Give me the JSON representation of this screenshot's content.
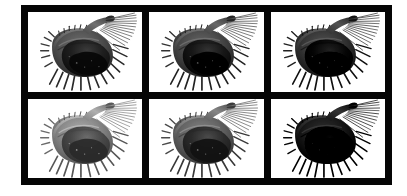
{
  "figure": {
    "title": "",
    "layout": {
      "type": "image-grid",
      "rows": 2,
      "columns": 3,
      "frame_color": "#050505",
      "panel_background": "#ffffff",
      "page_background": "#ffffff",
      "frame_x": 21,
      "frame_y": 5,
      "frame_width": 371,
      "frame_height": 180,
      "frame_padding": 7,
      "panel_gap": 7
    },
    "subject": {
      "description": "grayscale electron-micrograph style view of a spiny carapaced micro-organism",
      "common_name": "spined specimen",
      "orientation": "body lower-left, appendage and bristles extending upper-right",
      "color_mode": "grayscale"
    },
    "panels": [
      {
        "id": "panel-r1c1",
        "row": 1,
        "column": 1,
        "position_label": "top-left",
        "exposure_label": "normal",
        "exposure_class": "exp-normal",
        "relative_brightness": 1.0,
        "caption": ""
      },
      {
        "id": "panel-r1c2",
        "row": 1,
        "column": 2,
        "position_label": "top-center",
        "exposure_label": "normal",
        "exposure_class": "exp-mid",
        "relative_brightness": 0.94,
        "caption": ""
      },
      {
        "id": "panel-r1c3",
        "row": 1,
        "column": 3,
        "position_label": "top-right",
        "exposure_label": "dark",
        "exposure_class": "exp-dark",
        "relative_brightness": 0.8,
        "caption": ""
      },
      {
        "id": "panel-r2c1",
        "row": 2,
        "column": 1,
        "position_label": "bottom-left",
        "exposure_label": "bright",
        "exposure_class": "exp-bright",
        "relative_brightness": 1.72,
        "caption": ""
      },
      {
        "id": "panel-r2c2",
        "row": 2,
        "column": 2,
        "position_label": "bottom-center",
        "exposure_label": "lit",
        "exposure_class": "exp-lit",
        "relative_brightness": 1.2,
        "caption": ""
      },
      {
        "id": "panel-r2c3",
        "row": 2,
        "column": 3,
        "position_label": "bottom-right",
        "exposure_label": "darkest",
        "exposure_class": "exp-darkest",
        "relative_brightness": 0.62,
        "caption": ""
      }
    ]
  }
}
